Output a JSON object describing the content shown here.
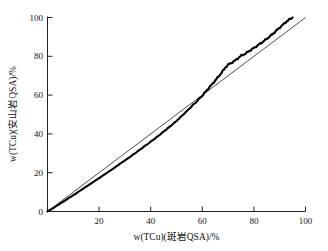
{
  "chart_data": {
    "type": "line",
    "title": "",
    "subtitle": "",
    "xlabel": "w(TCu)(斑岩QSA)/%",
    "ylabel": "w(TCu)(安山岩QSA)/%",
    "xlim": [
      0,
      100
    ],
    "ylim": [
      0,
      100
    ],
    "xticks": [
      0,
      20,
      40,
      60,
      80,
      100
    ],
    "yticks": [
      0,
      20,
      40,
      60,
      80,
      100
    ],
    "xtick_labels": [
      "0",
      "20",
      "40",
      "60",
      "80",
      "100"
    ],
    "ytick_labels": [
      "0",
      "20",
      "40",
      "60",
      "80",
      "100"
    ],
    "grid": false,
    "legend": "none",
    "colors": {
      "data_curve": "#000000",
      "reference_line": "#222222",
      "axis": "#222222",
      "background": "#ffffff"
    },
    "series": [
      {
        "name": "w(TCu)(安山岩QSA) vs w(TCu)(斑岩QSA)",
        "style": "thick-jagged-curve",
        "x": [
          0,
          2,
          4,
          6,
          8,
          10,
          12,
          14,
          16,
          18,
          20,
          22,
          24,
          26,
          28,
          30,
          32,
          34,
          36,
          38,
          40,
          42,
          44,
          46,
          48,
          50,
          52,
          54,
          56,
          58,
          60,
          61,
          62,
          63,
          64,
          65,
          66,
          67,
          68,
          69,
          70,
          71,
          72,
          73,
          74,
          75,
          76,
          77,
          78,
          79,
          80,
          81,
          82,
          83,
          84,
          85,
          86,
          87,
          88,
          89,
          90,
          91,
          92,
          93,
          94,
          95
        ],
        "y": [
          0,
          1.6,
          3.3,
          5.0,
          6.7,
          8.4,
          10.2,
          11.9,
          13.7,
          15.4,
          17.2,
          19.0,
          20.8,
          22.6,
          24.5,
          26.3,
          28.2,
          30.1,
          32.0,
          34.0,
          36.0,
          38.0,
          40.1,
          42.2,
          44.4,
          46.7,
          49.2,
          51.7,
          54.3,
          57.0,
          59.8,
          61.3,
          62.9,
          64.4,
          65.9,
          67.5,
          69.1,
          70.8,
          72.5,
          74.3,
          75.6,
          76.4,
          77.2,
          78.1,
          79.2,
          80.3,
          80.9,
          81.6,
          82.6,
          83.4,
          84.3,
          85.2,
          86.1,
          87.0,
          88.0,
          89.0,
          90.1,
          91.2,
          92.4,
          93.6,
          94.8,
          96.0,
          97.2,
          98.3,
          99.2,
          100.0
        ]
      },
      {
        "name": "1:1 reference line",
        "style": "thin-straight-line",
        "x": [
          0,
          100
        ],
        "y": [
          0,
          100
        ]
      }
    ]
  },
  "axes": {
    "x_title": "w(TCu)(斑岩QSA)/%",
    "y_title": "w(TCu)(安山岩QSA)/%",
    "x_tick_0": "0",
    "x_tick_1": "20",
    "x_tick_2": "40",
    "x_tick_3": "60",
    "x_tick_4": "80",
    "x_tick_5": "100",
    "y_tick_0": "0",
    "y_tick_1": "20",
    "y_tick_2": "40",
    "y_tick_3": "60",
    "y_tick_4": "80",
    "y_tick_5": "100"
  }
}
